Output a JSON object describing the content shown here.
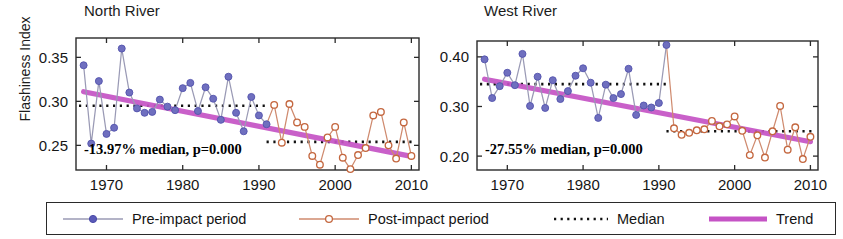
{
  "figure": {
    "ylabel": "Flashiness Index",
    "colors": {
      "pre_impact": "#6f6fbf",
      "pre_impact_line": "#9a9ab5",
      "post_impact": "#c4673f",
      "post_impact_line": "#cf8a6e",
      "median": "#111111",
      "trend": "#c553c5",
      "axis": "#2a2a2a"
    },
    "legend": {
      "items": [
        {
          "key": "pre",
          "label": "Pre-impact period",
          "marker": "filled-circle-icon",
          "color": "#6f6fbf"
        },
        {
          "key": "post",
          "label": "Post-impact period",
          "marker": "open-circle-icon",
          "color": "#c4673f"
        },
        {
          "key": "med",
          "label": "Median",
          "marker": "dotted-line-icon",
          "color": "#111111"
        },
        {
          "key": "trend",
          "label": "Trend",
          "marker": "thick-line-icon",
          "color": "#c553c5"
        }
      ]
    }
  },
  "chart_data": [
    {
      "type": "line",
      "panel": "left",
      "title": "North River",
      "xlabel": "",
      "ylabel": "Flashiness Index",
      "xlim": [
        1966,
        2011
      ],
      "ylim": [
        0.222,
        0.372
      ],
      "xticks": [
        1970,
        1980,
        1990,
        2000,
        2010
      ],
      "yticks": [
        0.25,
        0.3,
        0.35
      ],
      "ytick_labels": [
        "0.25",
        "0.30",
        "0.35"
      ],
      "xtick_labels": [
        "1970",
        "1980",
        "1990",
        "2000",
        "2010"
      ],
      "grid": false,
      "annotation": "-13.97% median, p=0.000",
      "median_pre": 0.295,
      "median_post": 0.254,
      "median_break_year": 1991,
      "trend": {
        "x": [
          1967,
          2010
        ],
        "y": [
          0.311,
          0.2375
        ]
      },
      "series": [
        {
          "name": "Pre-impact period",
          "color": "#6f6fbf",
          "x": [
            1967,
            1968,
            1969,
            1970,
            1971,
            1972,
            1973,
            1974,
            1975,
            1976,
            1977,
            1978,
            1979,
            1980,
            1981,
            1982,
            1983,
            1984,
            1985,
            1986,
            1987,
            1988,
            1989,
            1990,
            1991
          ],
          "y": [
            0.341,
            0.252,
            0.323,
            0.263,
            0.27,
            0.36,
            0.31,
            0.292,
            0.287,
            0.288,
            0.302,
            0.294,
            0.29,
            0.315,
            0.321,
            0.289,
            0.316,
            0.303,
            0.279,
            0.328,
            0.287,
            0.266,
            0.305,
            0.284,
            0.274
          ]
        },
        {
          "name": "Post-impact period",
          "color": "#c4673f",
          "x": [
            1992,
            1993,
            1994,
            1995,
            1996,
            1997,
            1998,
            1999,
            2000,
            2001,
            2002,
            2003,
            2004,
            2005,
            2006,
            2007,
            2008,
            2009,
            2010
          ],
          "y": [
            0.296,
            0.253,
            0.297,
            0.276,
            0.271,
            0.238,
            0.228,
            0.259,
            0.271,
            0.236,
            0.223,
            0.239,
            0.247,
            0.284,
            0.288,
            0.25,
            0.235,
            0.276,
            0.238
          ]
        }
      ]
    },
    {
      "type": "line",
      "panel": "right",
      "title": "West River",
      "xlabel": "",
      "ylabel": "",
      "xlim": [
        1966,
        2011
      ],
      "ylim": [
        0.172,
        0.432
      ],
      "xticks": [
        1970,
        1980,
        1990,
        2000,
        2010
      ],
      "yticks": [
        0.2,
        0.3,
        0.4
      ],
      "ytick_labels": [
        "0.20",
        "0.30",
        "0.40"
      ],
      "xtick_labels": [
        "1970",
        "1980",
        "1990",
        "2000",
        "2010"
      ],
      "grid": false,
      "annotation": "-27.55% median, p=0.000",
      "median_pre": 0.345,
      "median_post": 0.25,
      "median_break_year": 1991,
      "trend": {
        "x": [
          1967,
          2010
        ],
        "y": [
          0.355,
          0.229
        ]
      },
      "series": [
        {
          "name": "Pre-impact period",
          "color": "#6f6fbf",
          "x": [
            1967,
            1968,
            1969,
            1970,
            1971,
            1972,
            1973,
            1974,
            1975,
            1976,
            1977,
            1978,
            1979,
            1980,
            1981,
            1982,
            1983,
            1984,
            1985,
            1986,
            1987,
            1988,
            1989,
            1990,
            1991
          ],
          "y": [
            0.395,
            0.317,
            0.341,
            0.368,
            0.343,
            0.406,
            0.301,
            0.36,
            0.297,
            0.353,
            0.315,
            0.331,
            0.362,
            0.377,
            0.348,
            0.277,
            0.344,
            0.317,
            0.325,
            0.376,
            0.283,
            0.302,
            0.298,
            0.307,
            0.424
          ]
        },
        {
          "name": "Post-impact period",
          "color": "#c4673f",
          "x": [
            1992,
            1993,
            1994,
            1995,
            1996,
            1997,
            1998,
            1999,
            2000,
            2001,
            2002,
            2003,
            2004,
            2005,
            2006,
            2007,
            2008,
            2009,
            2010
          ],
          "y": [
            0.256,
            0.243,
            0.247,
            0.252,
            0.254,
            0.271,
            0.26,
            0.264,
            0.28,
            0.251,
            0.202,
            0.242,
            0.197,
            0.25,
            0.301,
            0.213,
            0.258,
            0.194,
            0.239
          ]
        }
      ]
    }
  ]
}
